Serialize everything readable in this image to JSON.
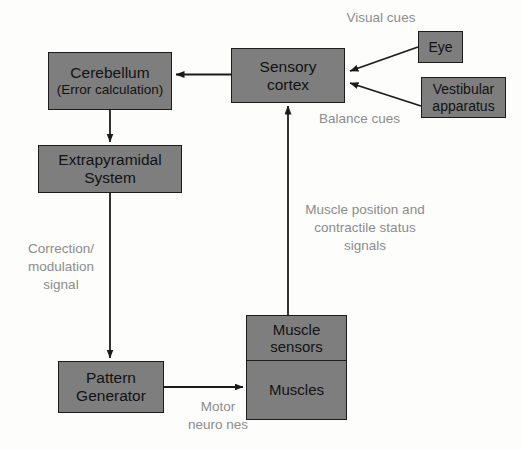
{
  "diagram": {
    "colors": {
      "box_fill": "#7e7e7e",
      "box_stroke": "#1b1b1b",
      "label_text": "#8c8c8c",
      "node_text": "#121212",
      "background": "#fdfdfc"
    },
    "nodes": [
      {
        "id": "cerebellum",
        "line1": "Cerebellum",
        "line2": "(Error calculation)"
      },
      {
        "id": "extrapyramidal",
        "line1": "Extrapyramidal",
        "line2": "System"
      },
      {
        "id": "pattern_generator",
        "line1": "Pattern",
        "line2": "Generator"
      },
      {
        "id": "sensory_cortex",
        "line1": "Sensory",
        "line2": "cortex"
      },
      {
        "id": "eye",
        "line1": "Eye"
      },
      {
        "id": "vestibular",
        "line1": "Vestibular",
        "line2": "apparatus"
      },
      {
        "id": "muscle_sensors",
        "line1": "Muscle",
        "line2": "sensors"
      },
      {
        "id": "muscles",
        "line1": "Muscles"
      }
    ],
    "edge_labels": [
      {
        "id": "visual_cues",
        "text": "Visual cues"
      },
      {
        "id": "balance_cues",
        "text": "Balance cues"
      },
      {
        "id": "muscle_feedback",
        "line1": "Muscle position and",
        "line2": "contractile status",
        "line3": "signals"
      },
      {
        "id": "correction_signal",
        "line1": "Correction/",
        "line2": "modulation",
        "line3": "signal"
      },
      {
        "id": "motor_neurones",
        "line1": "Motor",
        "line2": "neuro nes"
      }
    ]
  }
}
